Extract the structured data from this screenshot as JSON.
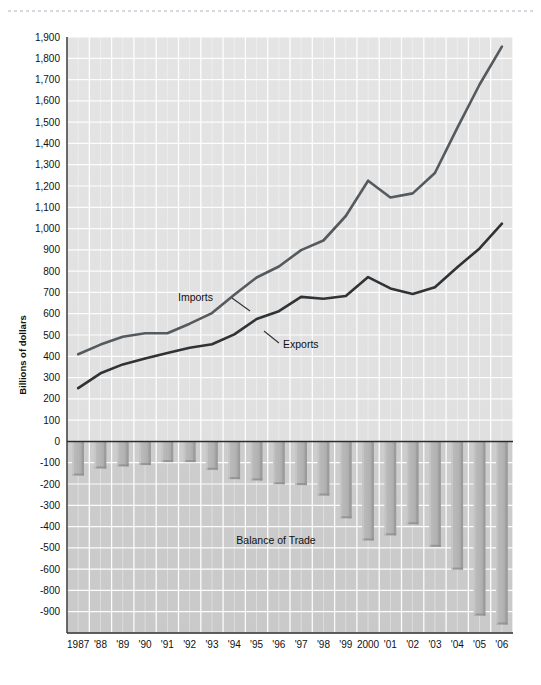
{
  "figure": {
    "ylabel": "Billions of dollars",
    "top_edge_marker": "perforation-dashes"
  },
  "chart_data": {
    "type": "line",
    "title": "",
    "xlabel": "",
    "ylabel": "Billions of dollars",
    "grid": true,
    "legend_position": "inline-annotations",
    "ylim": [
      -900,
      1900
    ],
    "ytick_step": 100,
    "x": [
      1987,
      1988,
      1989,
      1990,
      1991,
      1992,
      1993,
      1994,
      1995,
      1996,
      1997,
      1998,
      1999,
      2000,
      2001,
      2002,
      2003,
      2004,
      2005,
      2006
    ],
    "categories": [
      "1987",
      "'88",
      "'89",
      "'90",
      "'91",
      "'92",
      "'93",
      "'94",
      "'95",
      "'96",
      "'97",
      "'98",
      "'99",
      "2000",
      "'01",
      "'02",
      "'03",
      "'04",
      "'05",
      "'06"
    ],
    "ytick_labels": [
      "1,900",
      "1,800",
      "1,700",
      "1,600",
      "1,500",
      "1,400",
      "1,300",
      "1,200",
      "1,100",
      "1,000",
      "900",
      "800",
      "700",
      "600",
      "500",
      "400",
      "300",
      "200",
      "100",
      "0",
      "-100",
      "-200",
      "-300",
      "-400",
      "-500",
      "-600",
      "-800",
      "-900"
    ],
    "ytick_values": [
      1900,
      1800,
      1700,
      1600,
      1500,
      1400,
      1300,
      1200,
      1100,
      1000,
      900,
      800,
      700,
      600,
      500,
      400,
      300,
      200,
      100,
      0,
      -100,
      -200,
      -300,
      -400,
      -500,
      -600,
      -700,
      -800,
      -900
    ],
    "series": [
      {
        "name": "Imports",
        "type": "line",
        "color": "#555a5e",
        "annotation": "Imports",
        "values": [
          410,
          455,
          492,
          508,
          508,
          553,
          603,
          689,
          770,
          822,
          899,
          944,
          1059,
          1225,
          1146,
          1165,
          1261,
          1473,
          1677,
          1855
        ]
      },
      {
        "name": "Exports",
        "type": "line",
        "color": "#2f3336",
        "annotation": "Exports",
        "values": [
          250,
          320,
          362,
          389,
          416,
          440,
          457,
          503,
          575,
          612,
          679,
          670,
          683,
          772,
          719,
          693,
          724,
          818,
          907,
          1023
        ]
      },
      {
        "name": "Balance of Trade",
        "type": "bar",
        "color": "#b3b3b3",
        "annotation": "Balance of Trade",
        "values": [
          -160,
          -127,
          -117,
          -111,
          -97,
          -97,
          -133,
          -177,
          -183,
          -201,
          -205,
          -254,
          -361,
          -465,
          -441,
          -389,
          -495,
          -602,
          -818,
          -860
        ]
      }
    ],
    "annotations": [
      {
        "text": "Imports",
        "series": "Imports"
      },
      {
        "text": "Exports",
        "series": "Exports"
      },
      {
        "text": "Balance of Trade",
        "series": "Balance of Trade"
      }
    ]
  }
}
